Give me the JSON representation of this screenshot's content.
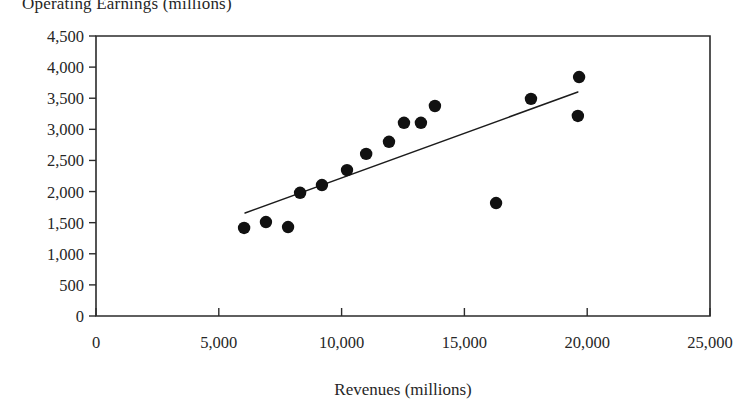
{
  "chart_data": {
    "type": "scatter",
    "title": "Operating Earnings (millions)",
    "xlabel": "Revenues (millions)",
    "ylabel": "",
    "xlim": [
      0,
      25000
    ],
    "ylim": [
      0,
      4500
    ],
    "grid": false,
    "legend": "none",
    "xticks": [
      0,
      5000,
      10000,
      15000,
      20000,
      25000
    ],
    "xtick_labels": [
      "0",
      "5,000",
      "10,000",
      "15,000",
      "20,000",
      "25,000"
    ],
    "yticks": [
      0,
      500,
      1000,
      1500,
      2000,
      2500,
      3000,
      3500,
      4000,
      4500
    ],
    "ytick_labels": [
      "0",
      "500",
      "1,000",
      "1,500",
      "2,000",
      "2,500",
      "3,000",
      "3,500",
      "4,000",
      "4,500"
    ],
    "series": [
      {
        "name": "Companies",
        "marker": "filled-circle",
        "color": "#111111",
        "points": [
          {
            "x": 6030,
            "y": 1415
          },
          {
            "x": 6920,
            "y": 1510
          },
          {
            "x": 7820,
            "y": 1430
          },
          {
            "x": 8310,
            "y": 1980
          },
          {
            "x": 9200,
            "y": 2105
          },
          {
            "x": 10220,
            "y": 2345
          },
          {
            "x": 11000,
            "y": 2605
          },
          {
            "x": 11930,
            "y": 2800
          },
          {
            "x": 12540,
            "y": 3105
          },
          {
            "x": 13230,
            "y": 3105
          },
          {
            "x": 13800,
            "y": 3375
          },
          {
            "x": 16290,
            "y": 1815
          },
          {
            "x": 17710,
            "y": 3490
          },
          {
            "x": 19620,
            "y": 3215
          },
          {
            "x": 19670,
            "y": 3840
          }
        ]
      }
    ],
    "trendline": {
      "name": "linear-fit",
      "color": "#1c1c1c",
      "start": {
        "x": 6070,
        "y": 1655
      },
      "end": {
        "x": 19620,
        "y": 3600
      }
    }
  }
}
